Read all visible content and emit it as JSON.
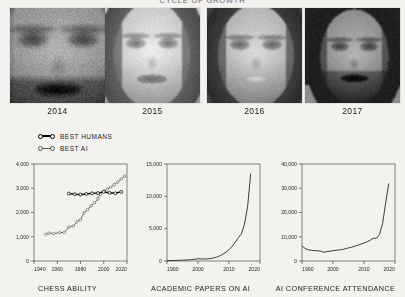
{
  "page": {
    "title": "CYCLE OF GROWTH",
    "background_color": "#f4f2ef"
  },
  "faces": {
    "section_name": "ai-generated-faces-progression",
    "items": [
      {
        "year": "2014",
        "alt": "blurry grayscale GAN-generated face, 2014"
      },
      {
        "year": "2015",
        "alt": "grayscale GAN-generated face of a woman, 2015"
      },
      {
        "year": "2016",
        "alt": "grayscale GAN-generated face of a smiling woman, 2016"
      },
      {
        "year": "2017",
        "alt": "grayscale GAN-generated face of a man, 2017"
      }
    ]
  },
  "legend": {
    "items": [
      {
        "label": "BEST HUMANS",
        "color": "#111111",
        "marker": "open-circle-line"
      },
      {
        "label": "BEST AI",
        "color": "#55504c",
        "marker": "open-circle-line"
      }
    ]
  },
  "chart_data": [
    {
      "type": "line",
      "title": "CHESS ABILITY",
      "xlabel": "",
      "ylabel": "",
      "xlim": [
        1940,
        2020
      ],
      "ylim": [
        0,
        4000
      ],
      "xticks": [
        1940,
        1960,
        1980,
        2000,
        2020
      ],
      "yticks": [
        0,
        1000,
        2000,
        3000,
        4000
      ],
      "ytick_labels": [
        "0",
        "1,000",
        "2,000",
        "3,000",
        "4,000"
      ],
      "xtick_labels": [
        "1940",
        "1960",
        "1980",
        "2000",
        "2020"
      ],
      "grid": false,
      "legend_position": "above-left",
      "series": [
        {
          "name": "BEST AI",
          "color": "#55504c",
          "markers": true,
          "x": [
            1950,
            1953,
            1957,
            1962,
            1966,
            1970,
            1974,
            1977,
            1980,
            1983,
            1986,
            1989,
            1992,
            1995,
            1997,
            2000,
            2003,
            2006,
            2009,
            2012,
            2015,
            2018
          ],
          "y": [
            1100,
            1150,
            1130,
            1170,
            1180,
            1400,
            1450,
            1620,
            1700,
            1980,
            2120,
            2270,
            2400,
            2560,
            2760,
            2880,
            2970,
            3050,
            3150,
            3250,
            3380,
            3500
          ]
        },
        {
          "name": "BEST HUMANS",
          "color": "#111111",
          "markers": true,
          "x": [
            1970,
            1975,
            1980,
            1985,
            1990,
            1995,
            2000,
            2005,
            2010,
            2015
          ],
          "y": [
            2780,
            2755,
            2740,
            2765,
            2790,
            2800,
            2850,
            2810,
            2790,
            2850
          ]
        }
      ]
    },
    {
      "type": "line",
      "title": "ACADEMIC PAPERS ON AI",
      "xlabel": "",
      "ylabel": "",
      "xlim": [
        1990,
        2020
      ],
      "ylim": [
        0,
        15000
      ],
      "xticks": [
        1990,
        2000,
        2010,
        2020
      ],
      "yticks": [
        0,
        5000,
        10000,
        15000
      ],
      "ytick_labels": [
        "0",
        "5,000",
        "10,000",
        "15,000"
      ],
      "xtick_labels": [
        "1990",
        "2000",
        "2010",
        "2020"
      ],
      "grid": false,
      "series": [
        {
          "name": "Academic papers on AI",
          "color": "#2a2724",
          "markers": false,
          "x": [
            1990,
            1992,
            1994,
            1996,
            1998,
            1999,
            2000,
            2001,
            2002,
            2003,
            2004,
            2005,
            2006,
            2007,
            2008,
            2009,
            2010,
            2011,
            2012,
            2013,
            2014,
            2015,
            2016,
            2017
          ],
          "y": [
            60,
            80,
            110,
            150,
            220,
            280,
            340,
            330,
            310,
            330,
            380,
            470,
            600,
            800,
            1050,
            1350,
            1750,
            2250,
            2900,
            3600,
            4200,
            5700,
            8400,
            13500
          ]
        }
      ]
    },
    {
      "type": "line",
      "title": "AI CONFERENCE ATTENDANCE",
      "xlabel": "",
      "ylabel": "",
      "xlim": [
        1990,
        2020
      ],
      "ylim": [
        0,
        40000
      ],
      "xticks": [
        1990,
        2000,
        2010,
        2020
      ],
      "yticks": [
        0,
        10000,
        20000,
        30000,
        40000
      ],
      "ytick_labels": [
        "0",
        "10,000",
        "20,000",
        "30,000",
        "40,000"
      ],
      "xtick_labels": [
        "1990",
        "2000",
        "2010",
        "2020"
      ],
      "grid": false,
      "series": [
        {
          "name": "AI conference attendance",
          "color": "#2a2724",
          "markers": false,
          "x": [
            1990,
            1991,
            1992,
            1993,
            1994,
            1995,
            1996,
            1997,
            1998,
            1999,
            2000,
            2001,
            2002,
            2003,
            2004,
            2005,
            2006,
            2007,
            2008,
            2009,
            2010,
            2011,
            2012,
            2013,
            2014,
            2015,
            2016,
            2017,
            2018
          ],
          "y": [
            6200,
            5200,
            4600,
            4400,
            4300,
            4200,
            4100,
            3600,
            3900,
            4000,
            4300,
            4400,
            4600,
            4700,
            5100,
            5400,
            5700,
            6100,
            6500,
            7000,
            7400,
            7900,
            8600,
            9400,
            9300,
            11000,
            15500,
            24000,
            32000
          ]
        }
      ]
    }
  ]
}
